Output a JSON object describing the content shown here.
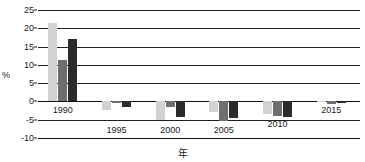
{
  "chart_data": {
    "type": "bar",
    "title": "",
    "subtitle": "",
    "xlabel": "年",
    "ylabel": "%",
    "categories": [
      "1990",
      "1995",
      "2000",
      "2005",
      "2010",
      "2015"
    ],
    "series": [
      {
        "name": "series-1",
        "color": "#d2d2d2",
        "values": [
          21.5,
          -2.4,
          -5.0,
          -3.0,
          -3.4,
          -0.2
        ]
      },
      {
        "name": "series-2",
        "color": "#6e6e6e",
        "values": [
          11.3,
          -0.3,
          -1.6,
          -5.3,
          -4.0,
          -0.6
        ]
      },
      {
        "name": "series-3",
        "color": "#2b2b2b",
        "values": [
          17.0,
          -1.4,
          -4.2,
          -4.6,
          -4.3,
          -0.5
        ]
      }
    ],
    "ylim": [
      -10,
      25
    ],
    "yticks": [
      25,
      20,
      15,
      10,
      5,
      0,
      -5,
      -10
    ],
    "ytick_labels": [
      "25",
      "20",
      "15",
      "10",
      "5",
      "0",
      "-5",
      "-10"
    ],
    "grid": true,
    "legend": "none",
    "xtick_labels": [
      "1990",
      "1995",
      "2000",
      "2005",
      "2010",
      "2015"
    ]
  }
}
